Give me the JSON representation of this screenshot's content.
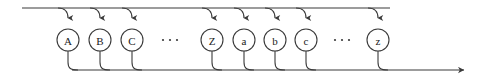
{
  "diagram": {
    "type": "railroad-state-diagram",
    "colors": {
      "stroke": "#3a3a3a",
      "label": "#1a1a1a",
      "background": "#ffffff"
    },
    "geometry": {
      "width": 493,
      "height": 77,
      "top_rail_y": 8,
      "bottom_rail_y": 70,
      "node_center_y": 40,
      "node_radius": 11,
      "top_rail_x_start": 22,
      "top_rail_x_end": 390,
      "bottom_rail_x_start": 72,
      "bottom_rail_x_end": 472
    },
    "nodes": [
      {
        "id": "node-upper-a",
        "label": "A",
        "cx": 68
      },
      {
        "id": "node-upper-b",
        "label": "B",
        "cx": 100
      },
      {
        "id": "node-upper-c",
        "label": "C",
        "cx": 132
      },
      {
        "id": "node-upper-z",
        "label": "Z",
        "cx": 212
      },
      {
        "id": "node-lower-a",
        "label": "a",
        "cx": 244
      },
      {
        "id": "node-lower-b",
        "label": "b",
        "cx": 275
      },
      {
        "id": "node-lower-c",
        "label": "c",
        "cx": 306
      },
      {
        "id": "node-lower-z",
        "label": "z",
        "cx": 378
      }
    ],
    "ellipses": [
      {
        "id": "ellipsis-uppercase",
        "cx": 170,
        "label": "..."
      },
      {
        "id": "ellipsis-lowercase",
        "cx": 342,
        "label": "..."
      }
    ]
  }
}
